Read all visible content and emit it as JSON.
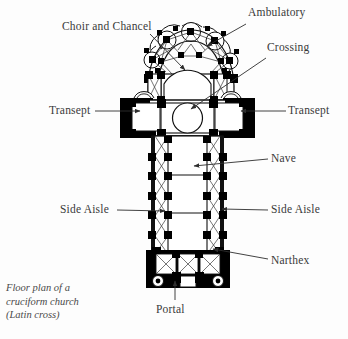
{
  "figure": {
    "caption": "Floor plan of a\ncruciform church\n(Latin cross)",
    "ink_color": "#000000",
    "label_color": "#3a3a3a",
    "background_color": "#fdfdfd"
  },
  "labels": [
    {
      "id": "ambulatory",
      "text": "Ambulatory",
      "x": 248,
      "y": 13,
      "align": "left"
    },
    {
      "id": "choir-and-chancel",
      "text": "Choir and Chancel",
      "x": 62,
      "y": 27,
      "align": "left"
    },
    {
      "id": "crossing",
      "text": "Crossing",
      "x": 267,
      "y": 48,
      "align": "left"
    },
    {
      "id": "transept-left",
      "text": "Transept",
      "x": 49,
      "y": 106,
      "align": "left"
    },
    {
      "id": "transept-right",
      "text": "Transept",
      "x": 288,
      "y": 106,
      "align": "left"
    },
    {
      "id": "nave",
      "text": "Nave",
      "x": 271,
      "y": 154,
      "align": "left"
    },
    {
      "id": "side-aisle-left",
      "text": "Side Aisle",
      "x": 66,
      "y": 205,
      "align": "left"
    },
    {
      "id": "side-aisle-right",
      "text": "Side Aisle",
      "x": 271,
      "y": 205,
      "align": "left"
    },
    {
      "id": "narthex",
      "text": "Narthex",
      "x": 271,
      "y": 256,
      "align": "left"
    },
    {
      "id": "portal",
      "text": "Portal",
      "x": 175,
      "y": 306,
      "align": "center"
    }
  ],
  "leaders": [
    {
      "id": "leader-ambulatory",
      "points": "246,24 207,46",
      "arrow": true
    },
    {
      "id": "leader-choir-and-chancel",
      "points": "150,34 185,70",
      "arrow": true
    },
    {
      "id": "leader-crossing",
      "points": "266,58 191,109",
      "arrow": true
    },
    {
      "id": "leader-transept-left",
      "points": "95,111 140,111",
      "arrow": true
    },
    {
      "id": "leader-transept-right",
      "points": "286,111 241,111",
      "arrow": true
    },
    {
      "id": "leader-nave",
      "points": "268,159 194,166",
      "arrow": true
    },
    {
      "id": "leader-side-aisle-left",
      "points": "117,210 165,211",
      "arrow": true
    },
    {
      "id": "leader-side-aisle-right",
      "points": "268,210 222,209",
      "arrow": true
    },
    {
      "id": "leader-narthex",
      "points": "268,259 213,249",
      "arrow": true
    },
    {
      "id": "leader-portal",
      "points": "175,300 175,281",
      "arrow": true
    }
  ],
  "plan": {
    "name": "cruciform-church-floor-plan",
    "description": "Latin cross plan: chevet with radiating chapels, ambulatory, choir and chancel, crossing, transepts, nave with side aisles, narthex with west towers, portal.",
    "zones": [
      {
        "id": "chevet",
        "label": "Ambulatory / radiating chapels"
      },
      {
        "id": "choir",
        "label": "Choir and Chancel"
      },
      {
        "id": "crossing",
        "label": "Crossing"
      },
      {
        "id": "transept-north",
        "label": "Transept"
      },
      {
        "id": "transept-south",
        "label": "Transept"
      },
      {
        "id": "nave",
        "label": "Nave"
      },
      {
        "id": "aisle-west",
        "label": "Side Aisle"
      },
      {
        "id": "aisle-east",
        "label": "Side Aisle"
      },
      {
        "id": "narthex",
        "label": "Narthex"
      },
      {
        "id": "portal",
        "label": "Portal"
      }
    ]
  }
}
